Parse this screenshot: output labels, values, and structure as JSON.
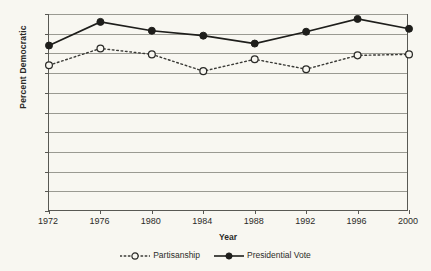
{
  "chart_data": {
    "type": "line",
    "title": "",
    "xlabel": "Year",
    "ylabel": "Percent Democratic",
    "categories": [
      "1972",
      "1976",
      "1980",
      "1984",
      "1988",
      "1992",
      "1996",
      "2000"
    ],
    "x": [
      1972,
      1976,
      1980,
      1984,
      1988,
      1992,
      1996,
      2000
    ],
    "xlim": [
      1972,
      2000
    ],
    "ylim": [
      0,
      100
    ],
    "yticks": [
      0,
      10,
      20,
      30,
      40,
      50,
      60,
      70,
      80,
      90,
      100
    ],
    "ytick_labels": [
      "0",
      "10",
      "20",
      "30",
      "40",
      "50",
      "60",
      "70",
      "80",
      "90",
      "100"
    ],
    "grid": true,
    "legend_position": "bottom-center",
    "series": [
      {
        "name": "Partisanship",
        "marker": "open-circle",
        "line_style": "dotted",
        "color": "#3a3a36",
        "values": [
          74,
          82.5,
          79.5,
          71,
          77,
          72,
          79,
          79.5
        ]
      },
      {
        "name": "Presidential Vote",
        "marker": "filled-circle",
        "line_style": "solid",
        "color": "#1e1e1b",
        "values": [
          84,
          96,
          91.5,
          89,
          85,
          91,
          97.5,
          92.5
        ]
      }
    ]
  },
  "legend": {
    "partisanship_label": "Partisanship",
    "presidential_vote_label": "Presidential Vote"
  },
  "colors": {
    "background": "#f8f7f1",
    "gridline": "#9a9a92",
    "axis": "#595954",
    "text": "#2b2b28"
  }
}
